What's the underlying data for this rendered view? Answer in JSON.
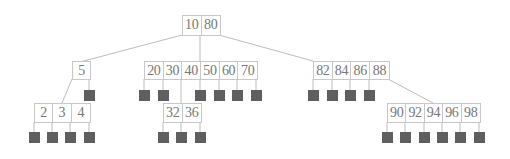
{
  "diagram": {
    "type": "b-tree",
    "colors": {
      "edge": "#bdbdbd",
      "box_border": "#c8c8c8",
      "key_text": "#777777",
      "null_leaf": "#5f5f5f"
    },
    "nodes": {
      "root": {
        "keys": [
          "10",
          "80"
        ]
      },
      "n5": {
        "keys": [
          "5"
        ]
      },
      "n20": {
        "keys": [
          "20",
          "30",
          "40",
          "50",
          "60",
          "70"
        ]
      },
      "n82": {
        "keys": [
          "82",
          "84",
          "86",
          "88"
        ]
      },
      "n2": {
        "keys": [
          "2",
          "3",
          "4"
        ]
      },
      "n32": {
        "keys": [
          "32",
          "36"
        ]
      },
      "n90": {
        "keys": [
          "90",
          "92",
          "94",
          "96",
          "98"
        ]
      }
    }
  }
}
